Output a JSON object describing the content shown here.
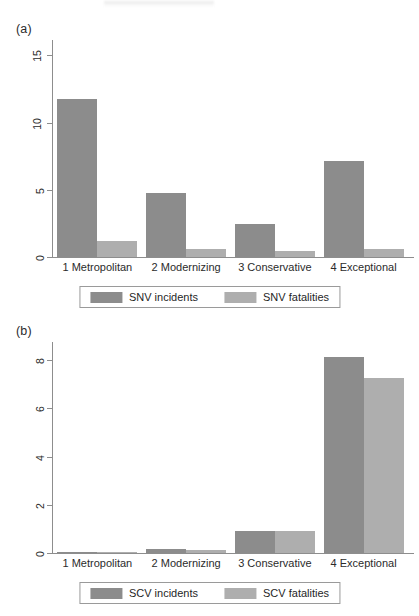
{
  "figure": {
    "panels": [
      {
        "tag": "(a)",
        "categories": [
          "1 Metropolitan",
          "2 Modernizing",
          "3 Conservative",
          "4 Exceptional"
        ],
        "yticks": [
          "0",
          "5",
          "10",
          "15"
        ],
        "legend": [
          {
            "label": "SNV incidents",
            "swatch": "swatch-incidents",
            "color": "#8c8c8c"
          },
          {
            "label": "SNV fatalities",
            "swatch": "swatch-fatalities",
            "color": "#aeaeae"
          }
        ]
      },
      {
        "tag": "(b)",
        "categories": [
          "1 Metropolitan",
          "2 Modernizing",
          "3 Conservative",
          "4 Exceptional"
        ],
        "yticks": [
          "0",
          "2",
          "4",
          "6",
          "8"
        ],
        "legend": [
          {
            "label": "SCV incidents",
            "swatch": "swatch-incidents",
            "color": "#8c8c8c"
          },
          {
            "label": "SCV fatalities",
            "swatch": "swatch-fatalities",
            "color": "#aeaeae"
          }
        ]
      }
    ]
  },
  "chart_data": [
    {
      "type": "bar",
      "panel": "(a)",
      "title": "",
      "xlabel": "",
      "ylabel": "",
      "categories": [
        "1 Metropolitan",
        "2 Modernizing",
        "3 Conservative",
        "4 Exceptional"
      ],
      "series": [
        {
          "name": "SNV incidents",
          "color": "#8c8c8c",
          "values": [
            11.8,
            4.8,
            2.5,
            7.2
          ]
        },
        {
          "name": "SNV fatalities",
          "color": "#aeaeae",
          "values": [
            1.2,
            0.6,
            0.45,
            0.6
          ]
        }
      ],
      "ylim": [
        0,
        16.2
      ],
      "yticks": [
        0,
        5,
        10,
        15
      ],
      "grid": false,
      "legend_position": "bottom"
    },
    {
      "type": "bar",
      "panel": "(b)",
      "title": "",
      "xlabel": "",
      "ylabel": "",
      "categories": [
        "1 Metropolitan",
        "2 Modernizing",
        "3 Conservative",
        "4 Exceptional"
      ],
      "series": [
        {
          "name": "SCV incidents",
          "color": "#8c8c8c",
          "values": [
            0.05,
            0.15,
            0.9,
            8.1
          ]
        },
        {
          "name": "SCV fatalities",
          "color": "#aeaeae",
          "values": [
            0.05,
            0.12,
            0.9,
            7.2
          ]
        }
      ],
      "ylim": [
        0,
        8.7
      ],
      "yticks": [
        0,
        2,
        4,
        6,
        8
      ],
      "grid": false,
      "legend_position": "bottom"
    }
  ]
}
